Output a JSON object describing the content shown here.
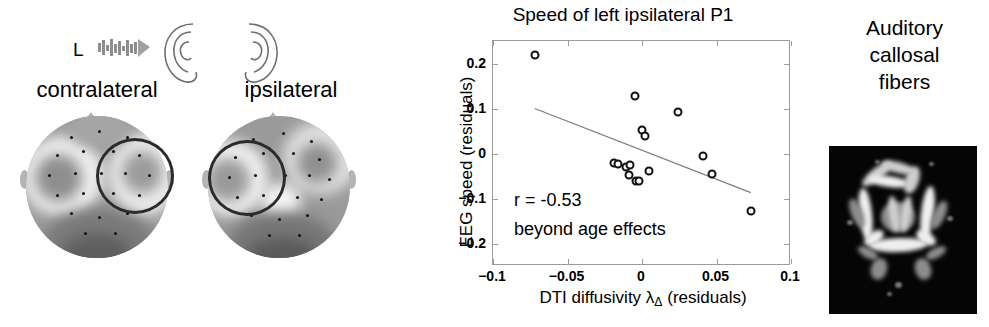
{
  "eeg_panel": {
    "stimulus_label": "L",
    "noise_icon": "sound-burst-icon",
    "ears": [
      "left-ear-icon",
      "right-ear-icon"
    ],
    "topoplots": [
      {
        "label": "contralateral",
        "roi_side": "right",
        "name": "topoplot-contralateral"
      },
      {
        "label": "ipsilateral",
        "roi_side": "left",
        "name": "topoplot-ipsilateral"
      }
    ]
  },
  "chart_data": {
    "type": "scatter",
    "title": "Speed of left ipsilateral P1",
    "xlabel_prefix": "DTI diffusivity ",
    "xlabel_symbol": "λ",
    "xlabel_sub": "Δ",
    "xlabel_suffix": " (residuals)",
    "xlabel": "DTI diffusivity λΔ (residuals)",
    "ylabel": "EEG speed (residuals)",
    "xlim": [
      -0.1,
      0.1
    ],
    "ylim": [
      -0.25,
      0.25
    ],
    "xticks": [
      -0.1,
      -0.05,
      0,
      0.05,
      0.1
    ],
    "xticklabels": [
      "−0.1",
      "−0.05",
      "0",
      "0.05",
      "0.1"
    ],
    "yticks": [
      0.2,
      0.1,
      0,
      -0.1,
      -0.2
    ],
    "yticklabels": [
      "0.2",
      "0.1",
      "0",
      "−0.1",
      "−0.2"
    ],
    "grid": false,
    "legend": null,
    "marker": "open-circle",
    "points": [
      {
        "x": -0.072,
        "y": 0.22
      },
      {
        "x": -0.005,
        "y": 0.128
      },
      {
        "x": 0.024,
        "y": 0.092
      },
      {
        "x": 0.0,
        "y": 0.053
      },
      {
        "x": 0.002,
        "y": 0.04
      },
      {
        "x": -0.019,
        "y": -0.022
      },
      {
        "x": -0.016,
        "y": -0.024
      },
      {
        "x": -0.011,
        "y": -0.03
      },
      {
        "x": -0.008,
        "y": -0.026
      },
      {
        "x": -0.009,
        "y": -0.048
      },
      {
        "x": -0.004,
        "y": -0.062
      },
      {
        "x": -0.002,
        "y": -0.06
      },
      {
        "x": 0.005,
        "y": -0.038
      },
      {
        "x": 0.041,
        "y": -0.005
      },
      {
        "x": 0.047,
        "y": -0.046
      },
      {
        "x": 0.073,
        "y": -0.128
      }
    ],
    "fit_line": {
      "x0": -0.072,
      "y0": 0.1,
      "x1": 0.073,
      "y1": -0.087
    },
    "annotations": [
      {
        "text": "r = -0.53"
      },
      {
        "text": "beyond age effects"
      }
    ]
  },
  "dti_panel": {
    "caption_lines": [
      "Auditory",
      "callosal",
      "fibers"
    ],
    "caption": "Auditory callosal fibers",
    "image_name": "dti-fiber-map"
  },
  "colors": {
    "axis": "#9c9c9c",
    "marker": "#111111",
    "fit_line": "#7d7d7d",
    "roi_outline": "#2b2b2b",
    "dti_background": "#050505",
    "dti_fiber": "#cfcfcf"
  }
}
